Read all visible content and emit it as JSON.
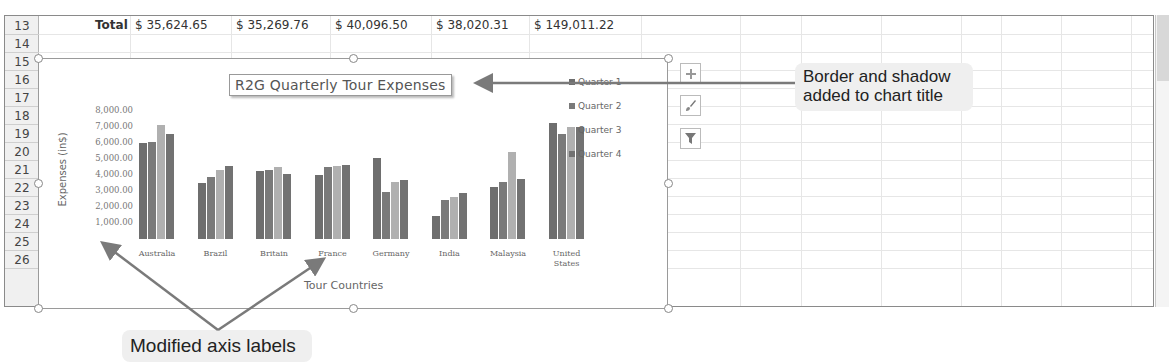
{
  "sheet": {
    "rows": [
      "13",
      "14",
      "15",
      "16",
      "17",
      "18",
      "19",
      "20",
      "21",
      "22",
      "23",
      "24",
      "25",
      "26"
    ],
    "total_row": {
      "label": "Total",
      "values": [
        "$ 35,624.65",
        "$ 35,269.76",
        "$ 40,096.50",
        "$ 38,020.31",
        "$ 149,011.22"
      ]
    }
  },
  "chart": {
    "title": "R2G Quarterly Tour Expenses",
    "y_axis_title": "Expenses (in$)",
    "x_axis_title": "Tour Countries",
    "y_ticks": [
      "8,000.00",
      "7,000.00",
      "6,000.00",
      "5,000.00",
      "4,000.00",
      "3,000.00",
      "2,000.00",
      "1,000.00"
    ],
    "categories": [
      "Australia",
      "Brazil",
      "Britain",
      "France",
      "Germany",
      "India",
      "Malaysia",
      "United States"
    ],
    "legend": [
      "Quarter 1",
      "Quarter 2",
      "Quarter 3",
      "Quarter 4"
    ],
    "series_colors": [
      "#6e6e6e",
      "#7a7a7a",
      "#b0b0b0",
      "#727272"
    ],
    "buttons": {
      "add": "chart-elements-button",
      "style": "chart-styles-button",
      "filter": "chart-filters-button"
    }
  },
  "chart_data": {
    "type": "bar",
    "title": "R2G Quarterly Tour Expenses",
    "xlabel": "Tour Countries",
    "ylabel": "Expenses (in$)",
    "ylim": [
      0,
      8000
    ],
    "y_ticks": [
      1000,
      2000,
      3000,
      4000,
      5000,
      6000,
      7000,
      8000
    ],
    "grid": false,
    "legend_position": "right",
    "categories": [
      "Australia",
      "Brazil",
      "Britain",
      "France",
      "Germany",
      "India",
      "Malaysia",
      "United States"
    ],
    "series": [
      {
        "name": "Quarter 1",
        "values": [
          6000,
          3500,
          4250,
          4000,
          5060,
          1440,
          3250,
          7250
        ]
      },
      {
        "name": "Quarter 2",
        "values": [
          6050,
          3870,
          4310,
          4500,
          2940,
          2440,
          3560,
          6560
        ]
      },
      {
        "name": "Quarter 3",
        "values": [
          7100,
          4310,
          4500,
          4560,
          3560,
          2620,
          5440,
          7000
        ]
      },
      {
        "name": "Quarter 4",
        "values": [
          6550,
          4560,
          4060,
          4620,
          3690,
          2870,
          3750,
          7000
        ]
      }
    ]
  },
  "callouts": {
    "title_callout": "Border and shadow added to chart title",
    "title_callout_line1": "Border and shadow",
    "title_callout_line2": "added to chart title",
    "axis_callout": "Modified axis labels"
  }
}
